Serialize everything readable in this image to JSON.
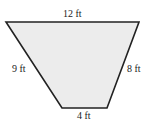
{
  "figure": {
    "shape": "trapezoid",
    "fill_color": "#ececec",
    "stroke_color": "#222222",
    "labels": {
      "top": "12 ft",
      "left": "9 ft",
      "right": "8 ft",
      "bottom": "4 ft"
    },
    "sides": [
      {
        "name": "top",
        "length": 12,
        "unit": "ft"
      },
      {
        "name": "left",
        "length": 9,
        "unit": "ft"
      },
      {
        "name": "right",
        "length": 8,
        "unit": "ft"
      },
      {
        "name": "bottom",
        "length": 4,
        "unit": "ft"
      }
    ]
  }
}
